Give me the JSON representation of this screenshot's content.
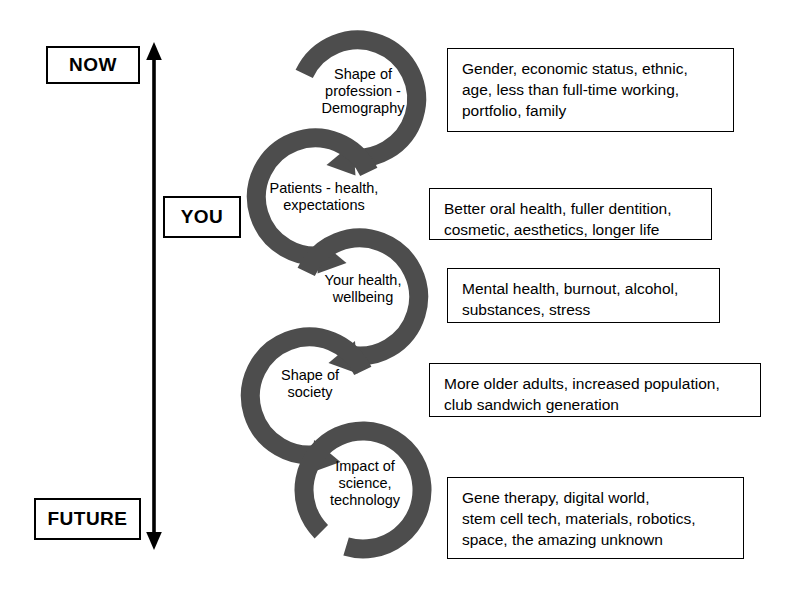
{
  "timeline": {
    "top_label": "NOW",
    "middle_label": "YOU",
    "bottom_label": "FUTURE",
    "arrow_direction": "double-headed-vertical"
  },
  "colors": {
    "arrow_ring": "#4d4d4d",
    "outline": "#000000",
    "background": "#ffffff"
  },
  "cycle": {
    "nodes": [
      {
        "id": "demography",
        "label": "Shape of\nprofession -\nDemography",
        "details": "Gender, economic status, ethnic,\nage, less than full-time working,\nportfolio, family"
      },
      {
        "id": "patients",
        "label": "Patients - health,\nexpectations",
        "details": "Better oral health, fuller dentition,\ncosmetic, aesthetics, longer life"
      },
      {
        "id": "your-health",
        "label": "Your health,\nwellbeing",
        "details": "Mental health, burnout, alcohol,\nsubstances, stress"
      },
      {
        "id": "society",
        "label": "Shape of\nsociety",
        "details": "More older adults, increased population,\nclub sandwich generation"
      },
      {
        "id": "science",
        "label": "Impact of\nscience,\ntechnology",
        "details": "Gene therapy, digital world,\nstem cell tech, materials, robotics,\nspace, the amazing unknown"
      }
    ]
  }
}
